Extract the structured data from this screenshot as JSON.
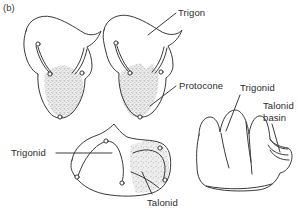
{
  "figure": {
    "panel_letter": "(b)",
    "caption_text": "",
    "background_color": "#ffffff",
    "ink_color": "#3a3a3a",
    "stipple_color": "#b9b9b9",
    "stipple_fill": "#e6e6e6"
  },
  "labels": {
    "trigon": "Trigon",
    "protocone": "Protocone",
    "trigonid_lower": "Trigonid",
    "talonid": "Talonid",
    "trigonid_lateral": "Trigonid",
    "talonid_basin_line1": "Talonid",
    "talonid_basin_line2": "basin"
  },
  "structures": {
    "upper_molar_left": {
      "name": "upper-molar-occlusal-left",
      "shaded_region": "protocone / trigon basin",
      "cusp_count": 4
    },
    "upper_molar_right": {
      "name": "upper-molar-occlusal-right",
      "shaded_region": "protocone / trigon basin",
      "cusp_count": 4
    },
    "lower_molar": {
      "name": "lower-molar-occlusal",
      "shaded_region": "talonid basin",
      "unshaded_region": "trigonid",
      "cusp_count": 5
    },
    "lateral_view": {
      "name": "lower-molar-lateral-view",
      "tall_cusps": "trigonid",
      "low_region": "talonid basin"
    }
  }
}
